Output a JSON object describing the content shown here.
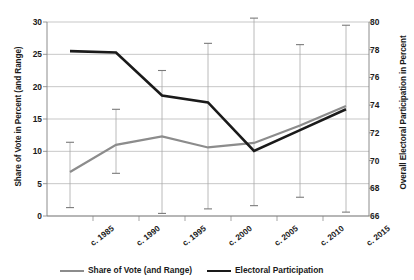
{
  "chart_data": {
    "type": "line",
    "title": "",
    "categories": [
      "c. 1985",
      "c. 1990",
      "c. 1995",
      "c. 2000",
      "c. 2005",
      "c. 2010",
      "c. 2015"
    ],
    "ylabel": "Share of Vote in Percent (and Range)",
    "ylabel_right": "Overall Electoral Participation in Percent",
    "xlabel": "",
    "ylim": [
      0,
      30
    ],
    "ylim_right": [
      66,
      80
    ],
    "yticks": [
      0,
      5,
      10,
      15,
      20,
      25,
      30
    ],
    "yticks_right": [
      66,
      68,
      70,
      72,
      74,
      76,
      78,
      80
    ],
    "grid": true,
    "legend_position": "bottom",
    "series": [
      {
        "name": "Share of Vote (and Range)",
        "axis": "left",
        "color": "#8c8c8c",
        "values": [
          6.8,
          11.0,
          12.3,
          10.6,
          11.3,
          14.0,
          17.0
        ],
        "range_low": [
          1.3,
          6.6,
          0.4,
          1.1,
          1.6,
          2.9,
          0.6
        ],
        "range_high": [
          11.4,
          16.5,
          22.5,
          26.7,
          30.6,
          26.5,
          29.5
        ]
      },
      {
        "name": "Electoral Participation",
        "axis": "right",
        "color": "#1a1a1a",
        "values": [
          77.9,
          77.8,
          74.7,
          74.2,
          70.7,
          72.2,
          73.7
        ]
      }
    ]
  },
  "legend": {
    "items": [
      {
        "label": "Share of Vote (and Range)",
        "color": "#8c8c8c"
      },
      {
        "label": "Electoral Participation",
        "color": "#1a1a1a"
      }
    ]
  }
}
